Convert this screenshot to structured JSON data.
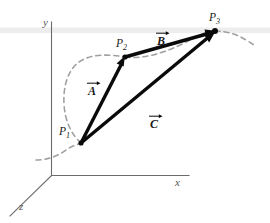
{
  "figure": {
    "background_color": "#ffffff",
    "ink_color": "#0a0a0a",
    "axis_color": "#6b6b6b",
    "curve_color": "#a0a0a0",
    "width": 270,
    "height": 223
  },
  "axes": [
    {
      "id": "y",
      "label": "y",
      "x": 43,
      "y": 17
    },
    {
      "id": "x",
      "label": "x",
      "x": 175,
      "y": 177
    },
    {
      "id": "z",
      "label": "z",
      "x": 19,
      "y": 201
    }
  ],
  "points": [
    {
      "id": "P1",
      "label": "P",
      "subscript": "1",
      "x": 81,
      "y": 143,
      "label_x": 59,
      "label_y": 126
    },
    {
      "id": "P2",
      "label": "P",
      "subscript": "2",
      "x": 125,
      "y": 57,
      "label_x": 116,
      "label_y": 38
    },
    {
      "id": "P3",
      "label": "P",
      "subscript": "3",
      "x": 215,
      "y": 31,
      "label_x": 209,
      "label_y": 12
    }
  ],
  "vectors": [
    {
      "id": "A",
      "label": "A",
      "from": "P1",
      "to": "P2",
      "label_x": 88,
      "label_y": 85,
      "description": "displacement from P1 to P2"
    },
    {
      "id": "B",
      "label": "B",
      "from": "P2",
      "to": "P3",
      "label_x": 157,
      "label_y": 23,
      "description": "displacement from P2 to P3"
    },
    {
      "id": "C",
      "label": "C",
      "from": "P1",
      "to": "P3",
      "label_x": 150,
      "label_y": 94,
      "description": "resultant displacement from P1 to P3"
    }
  ],
  "path_curve": {
    "id": "trajectory",
    "style": "dashed",
    "description": "dashed curved path passing through P1, P2 and P3"
  }
}
